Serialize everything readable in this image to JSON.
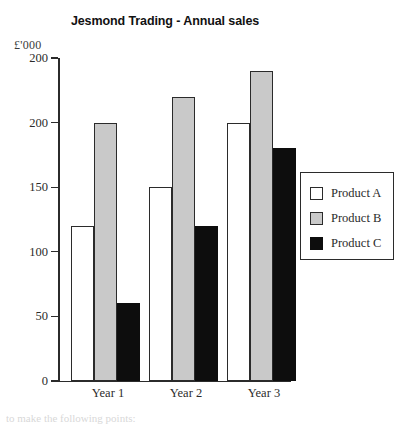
{
  "chart_data": {
    "type": "bar",
    "title": "Jesmond Trading - Annual sales",
    "xlabel": "",
    "ylabel": "£'000",
    "categories": [
      "Year 1",
      "Year 2",
      "Year 3"
    ],
    "series": [
      {
        "name": "Product A",
        "color": "#ffffff",
        "values": [
          120,
          150,
          200
        ]
      },
      {
        "name": "Product B",
        "color": "#c9c9c9",
        "values": [
          200,
          220,
          240
        ]
      },
      {
        "name": "Product C",
        "color": "#0d0d0d",
        "values": [
          60,
          120,
          180
        ]
      }
    ],
    "ylim": [
      0,
      250
    ],
    "ytick_values": [
      0,
      50,
      100,
      150,
      200,
      250
    ],
    "ytick_labels": [
      "0",
      "50",
      "100",
      "150",
      "200",
      "200"
    ],
    "grid": false,
    "legend_position": "right"
  },
  "chart": {
    "title": "Jesmond Trading - Annual sales",
    "y_unit_label": "£'000",
    "y_ticks": [
      {
        "label": "200",
        "value": 250
      },
      {
        "label": "200",
        "value": 200
      },
      {
        "label": "150",
        "value": 150
      },
      {
        "label": "100",
        "value": 100
      },
      {
        "label": "50",
        "value": 50
      },
      {
        "label": "0",
        "value": 0
      }
    ],
    "groups": [
      {
        "label": "Year 1",
        "bars": [
          {
            "series": "Product A",
            "value": 120
          },
          {
            "series": "Product B",
            "value": 200
          },
          {
            "series": "Product C",
            "value": 60
          }
        ]
      },
      {
        "label": "Year 2",
        "bars": [
          {
            "series": "Product A",
            "value": 150
          },
          {
            "series": "Product B",
            "value": 220
          },
          {
            "series": "Product C",
            "value": 120
          }
        ]
      },
      {
        "label": "Year 3",
        "bars": [
          {
            "series": "Product A",
            "value": 200
          },
          {
            "series": "Product B",
            "value": 240
          },
          {
            "series": "Product C",
            "value": 180
          }
        ]
      }
    ],
    "legend": {
      "items": [
        {
          "label": "Product A",
          "swatch": "white"
        },
        {
          "label": "Product B",
          "swatch": "grey"
        },
        {
          "label": "Product C",
          "swatch": "black"
        }
      ]
    }
  },
  "footer": {
    "caption": "to make the following points:"
  }
}
